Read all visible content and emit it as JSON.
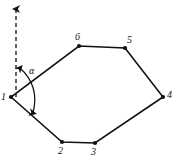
{
  "figure": {
    "kind": "closed-traverse-polygon-diagram",
    "width": 177,
    "height": 168,
    "background_color": "#ffffff",
    "ink_color": "#111111",
    "stroke_width": 1.6,
    "vertex_dot_radius": 2.1
  },
  "chart_data": {
    "type": "scatter",
    "title": "",
    "subtitle": "",
    "xlabel": "",
    "ylabel": "",
    "xlim": [
      0,
      177
    ],
    "ylim": [
      0,
      168
    ],
    "grid": false,
    "legend": false,
    "categories": [
      "1",
      "2",
      "3",
      "4",
      "5",
      "6"
    ],
    "series": [
      {
        "name": "traverse-vertices",
        "points": [
          {
            "label": "1",
            "x": 11,
            "y": 97
          },
          {
            "label": "2",
            "x": 62,
            "y": 142
          },
          {
            "label": "3",
            "x": 95,
            "y": 143
          },
          {
            "label": "4",
            "x": 163,
            "y": 97
          },
          {
            "label": "5",
            "x": 125,
            "y": 48
          },
          {
            "label": "6",
            "x": 79,
            "y": 46
          }
        ]
      }
    ],
    "annotations": [
      {
        "name": "angle-alpha",
        "text": "α",
        "x": 30,
        "y": 72
      },
      {
        "name": "north-arrow",
        "text": "",
        "x": 16,
        "y": 5
      }
    ]
  },
  "polygon": {
    "name": "closed-traverse",
    "closed": true,
    "vertices": [
      {
        "id": "v1",
        "label": "1",
        "x": 11,
        "y": 97,
        "label_x": 1,
        "label_y": 92
      },
      {
        "id": "v2",
        "label": "2",
        "x": 62,
        "y": 142,
        "label_x": 58,
        "label_y": 146
      },
      {
        "id": "v3",
        "label": "3",
        "x": 95,
        "y": 143,
        "label_x": 91,
        "label_y": 147
      },
      {
        "id": "v4",
        "label": "4",
        "x": 163,
        "y": 97,
        "label_x": 167,
        "label_y": 90
      },
      {
        "id": "v5",
        "label": "5",
        "x": 125,
        "y": 48,
        "label_x": 127,
        "label_y": 35
      },
      {
        "id": "v6",
        "label": "6",
        "x": 79,
        "y": 46,
        "label_x": 75,
        "label_y": 32
      }
    ],
    "edges": [
      {
        "from": "1",
        "to": "2"
      },
      {
        "from": "2",
        "to": "3"
      },
      {
        "from": "3",
        "to": "4"
      },
      {
        "from": "4",
        "to": "5"
      },
      {
        "from": "5",
        "to": "6"
      },
      {
        "from": "6",
        "to": "1"
      }
    ],
    "path": "M 11 97 L 62 142 L 95 143 L 163 97 L 125 48 L 79 46 Z"
  },
  "reference_direction": {
    "name": "north-reference-line",
    "style": "dashed",
    "dash_pattern": "4 3",
    "from_x": 16,
    "from_y": 97,
    "to_x": 16,
    "to_y": 9,
    "arrowhead": "up",
    "arrowhead_tip_x": 16,
    "arrowhead_tip_y": 3
  },
  "angle_marker": {
    "name": "bearing-angle-alpha",
    "symbol": "α",
    "label_x": 29,
    "label_y": 66,
    "arc_path": "M 20 68 Q 40 86 33 113",
    "arrow_start_tip_x": 19,
    "arrow_start_tip_y": 64,
    "arrow_end_tip_x": 32,
    "arrow_end_tip_y": 117,
    "measured_between": [
      "north-reference-line",
      "edge-1-2"
    ],
    "double_headed": true
  },
  "accessibility": {
    "description": "Closed traverse polygon with six numbered stations and a dashed north reference arrow at station 1; angle alpha is marked between the north direction and the line from station 1 to station 2."
  }
}
